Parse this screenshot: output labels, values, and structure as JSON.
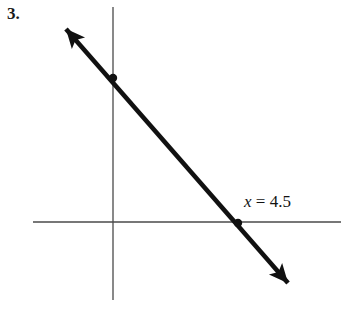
{
  "figure": {
    "problem_number": "3.",
    "background_color": "#ffffff",
    "width": 346,
    "height": 311
  },
  "axes": {
    "axis_color": "#4a4a4a",
    "axis_stroke_width": 1.3,
    "origin": {
      "x": 113,
      "y": 222
    },
    "x_axis": {
      "x1": 33,
      "y1": 222,
      "x2": 341,
      "y2": 222,
      "name": "horizontal-axis"
    },
    "y_axis": {
      "x1": 113,
      "y1": 7,
      "x2": 113,
      "y2": 300,
      "name": "vertical-axis"
    }
  },
  "plotted_line": {
    "color": "#111111",
    "stroke_width": 4.6,
    "start": {
      "x": 66,
      "y": 29
    },
    "end": {
      "x": 288,
      "y": 283
    },
    "arrow_start_tip": {
      "x": 61,
      "y": 24
    },
    "arrow_end_tip": {
      "x": 293,
      "y": 289
    },
    "double_headed": true
  },
  "markers": [
    {
      "name": "y-intercept-point",
      "x": 113,
      "y": 78,
      "radius": 4.2,
      "color": "#111111"
    },
    {
      "name": "x-intercept-point",
      "x": 238,
      "y": 223,
      "radius": 4.2,
      "color": "#111111"
    }
  ],
  "annotation": {
    "variable": "x",
    "equals": " = ",
    "value": "4.5",
    "full_text": "x = 4.5",
    "color": "#121212"
  },
  "chart_data": {
    "type": "line",
    "title": "",
    "xlabel": "",
    "ylabel": "",
    "annotations": [
      "x = 4.5"
    ],
    "series": [
      {
        "name": "line",
        "description": "A straight line with negative slope drawn as a double-headed arrow",
        "points": [
          {
            "x": 0,
            "y": 6.5,
            "label": "y-intercept"
          },
          {
            "x": 4.5,
            "y": 0,
            "label": "x-intercept"
          }
        ]
      }
    ],
    "marked_points": [
      {
        "x": 0,
        "y": 6.5
      },
      {
        "x": 4.5,
        "y": 0
      }
    ],
    "grid": false,
    "legend": "none"
  }
}
